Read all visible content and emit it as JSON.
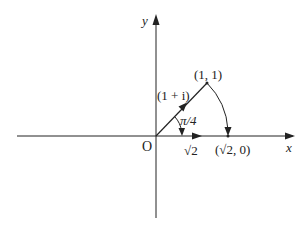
{
  "diagram": {
    "axes": {
      "x_label": "x",
      "y_label": "y",
      "origin_label": "O"
    },
    "vector": {
      "label": "(1 + i)",
      "tip_label": "(1, 1)"
    },
    "angle": {
      "label": "π/4"
    },
    "x_axis_vector": {
      "label": "√2"
    },
    "rotated_point": {
      "label": "(√2, 0)"
    },
    "colors": {
      "stroke": "#222222",
      "background": "#ffffff"
    }
  }
}
